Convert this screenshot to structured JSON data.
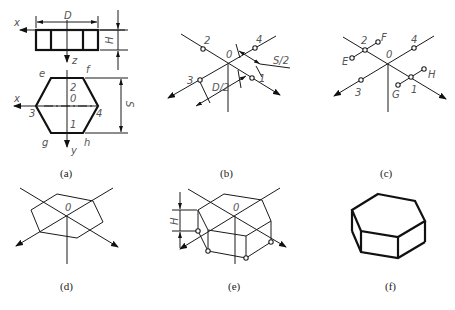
{
  "figure": {
    "panels": [
      {
        "id": "a",
        "caption": "(a)",
        "labels": {
          "dim_D": "D",
          "dim_H": "H",
          "dim_S": "S",
          "axis_x_top": "x",
          "axis_z": "z",
          "axis_x": "x",
          "axis_y": "y",
          "origin": "0",
          "p1": "1",
          "p2": "2",
          "p3": "3",
          "p4": "4",
          "e": "e",
          "f": "f",
          "g": "g",
          "h": "h"
        }
      },
      {
        "id": "b",
        "caption": "(b)",
        "labels": {
          "origin": "0",
          "p1": "1",
          "p2": "2",
          "p3": "3",
          "p4": "4",
          "half_S": "S/2",
          "half_D": "D/2"
        }
      },
      {
        "id": "c",
        "caption": "(c)",
        "labels": {
          "origin": "0",
          "p1": "1",
          "p2": "2",
          "p3": "3",
          "p4": "4",
          "E": "E",
          "F": "F",
          "G": "G",
          "H": "H"
        }
      },
      {
        "id": "d",
        "caption": "(d)",
        "labels": {
          "origin": "0"
        }
      },
      {
        "id": "e",
        "caption": "(e)",
        "labels": {
          "origin": "0",
          "dim_H": "H"
        }
      },
      {
        "id": "f",
        "caption": "(f)",
        "labels": {}
      }
    ]
  }
}
